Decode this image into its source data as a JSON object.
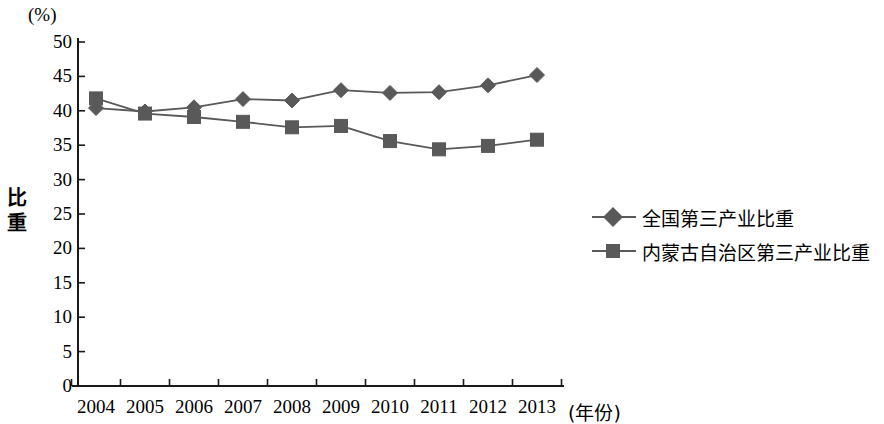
{
  "chart_data": {
    "type": "line",
    "title": "",
    "subtitle": "",
    "unit_label": "(%)",
    "ylabel": "比重",
    "xlabel": "(年份)",
    "categories": [
      "2004",
      "2005",
      "2006",
      "2007",
      "2008",
      "2009",
      "2010",
      "2011",
      "2012",
      "2013"
    ],
    "ylim": [
      0,
      50
    ],
    "yticks": [
      "0",
      "5",
      "10",
      "15",
      "20",
      "25",
      "30",
      "35",
      "40",
      "45",
      "50"
    ],
    "grid": false,
    "legend_position": "right",
    "series": [
      {
        "name": "全国第三产业比重",
        "marker": "diamond",
        "color": "#595959",
        "values": [
          40.4,
          39.9,
          40.5,
          41.7,
          41.5,
          43.0,
          42.6,
          42.7,
          43.7,
          45.2
        ]
      },
      {
        "name": "内蒙古自治区第三产业比重",
        "marker": "square",
        "color": "#595959",
        "values": [
          41.8,
          39.6,
          39.1,
          38.4,
          37.6,
          37.8,
          35.6,
          34.4,
          34.9,
          35.8
        ]
      }
    ]
  },
  "axis": {
    "unit": "(%)",
    "y_title_chars": [
      "比",
      "重"
    ],
    "x_unit": "(年份)"
  },
  "colors": {
    "series": "#595959",
    "axis": "#1a1a1a",
    "background": "#ffffff"
  }
}
